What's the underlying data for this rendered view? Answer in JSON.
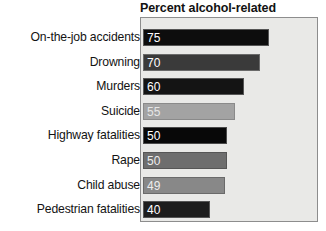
{
  "chart_data": {
    "type": "bar",
    "orientation": "horizontal",
    "title": "Percent alcohol-related",
    "xlabel": "",
    "ylabel": "",
    "xlim": [
      0,
      75
    ],
    "grid": false,
    "legend": false,
    "categories": [
      "On-the-job accidents",
      "Drowning",
      "Murders",
      "Suicide",
      "Highway fatalities",
      "Rape",
      "Child abuse",
      "Pedestrian fatalities"
    ],
    "values": [
      75,
      70,
      60,
      55,
      50,
      50,
      49,
      40
    ],
    "value_labels": [
      "75",
      "70",
      "60",
      "55",
      "50",
      "50",
      "49",
      "40"
    ],
    "bar_colors": [
      "#0d0d0d",
      "#3a3a3a",
      "#141414",
      "#a3a3a3",
      "#080808",
      "#6e6e6e",
      "#888888",
      "#1d1d1d"
    ],
    "bar_border_colors": [
      "#555555",
      "#6a6a6a",
      "#555555",
      "#8a8a8a",
      "#4a4a4a",
      "#565656",
      "#6a6a6a",
      "#555555"
    ],
    "value_label_colors": [
      "#ffffff",
      "#ffffff",
      "#ffffff",
      "#e6e6e6",
      "#ffffff",
      "#ededed",
      "#ededed",
      "#ffffff"
    ],
    "panel_background": "#e9e9e7",
    "panel_border": "#8d8d8d",
    "title_color": "#121212",
    "label_color": "#131313"
  }
}
